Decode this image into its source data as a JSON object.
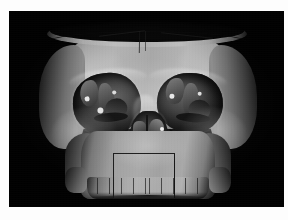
{
  "viewer": {
    "title": "3D volume-rendered CT skull",
    "background_color": "#010101",
    "page_color": "#fdfdfd",
    "canvas": {
      "x": 9,
      "y": 11,
      "width": 275,
      "height": 196
    }
  },
  "rendering": {
    "modality": "CT",
    "mode": "volume-rendering",
    "colormap": "grayscale",
    "orientation": "anterior",
    "overlay_box_color": "#1a1a1a"
  },
  "anatomy": {
    "label_vault": "cranial vault",
    "label_cut_rim": "craniotomy cut rim",
    "label_orbit_left": "left orbit",
    "label_orbit_right": "right orbit",
    "label_nasal": "nasal cavity",
    "label_maxilla": "maxilla",
    "label_teeth": "upper dentition",
    "label_zygoma_left": "left zygomatic arch",
    "label_zygoma_right": "right zygomatic arch"
  },
  "overlay": {
    "roi_label": "clipping box",
    "roi": {
      "x": 84,
      "y": 142,
      "width": 62,
      "height": 46
    }
  },
  "teeth_gaps": [
    10,
    22,
    34,
    46,
    58,
    62,
    74,
    86,
    98,
    110
  ]
}
